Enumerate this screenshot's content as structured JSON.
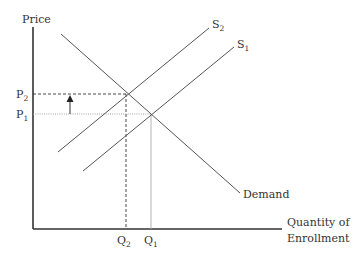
{
  "diagram": {
    "type": "supply-demand",
    "y_axis_label": "Price",
    "x_axis_label_line1": "Quantity of",
    "x_axis_label_line2": "Enrollment",
    "curves": {
      "demand": {
        "label": "Demand"
      },
      "supply1": {
        "label": "S",
        "subscript": "1"
      },
      "supply2": {
        "label": "S",
        "subscript": "2"
      }
    },
    "price_levels": [
      {
        "label": "P",
        "subscript": "2"
      },
      {
        "label": "P",
        "subscript": "1"
      }
    ],
    "quantity_levels": [
      {
        "label": "Q",
        "subscript": "2"
      },
      {
        "label": "Q",
        "subscript": "1"
      }
    ],
    "annotation": "upward arrow from P1 to P2",
    "colors": {
      "axis": "#333333",
      "curve": "#555555",
      "guide_dark": "#333333",
      "guide_light": "#aaaaaa",
      "text": "#333333"
    }
  }
}
